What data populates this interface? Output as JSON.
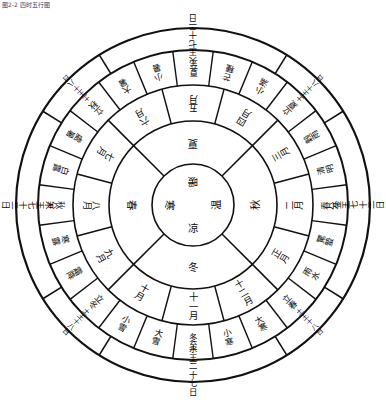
{
  "caption": "图2-2 四时五行图",
  "diagram": {
    "center": {
      "labels": [
        "暖",
        "温",
        "凉",
        "寒"
      ],
      "note": "center four qi"
    },
    "ring_season": {
      "name": "four-seasons-ring",
      "labels": [
        "夏",
        "秋",
        "冬",
        "春"
      ]
    },
    "ring_months": {
      "name": "twelve-months-ring",
      "labels": [
        "五月",
        "四月",
        "三月",
        "二月",
        "正月",
        "十二月",
        "十一月",
        "十月",
        "九月",
        "八月",
        "七月",
        "六月"
      ]
    },
    "ring_terms": {
      "name": "twentyfour-solar-terms-ring",
      "labels": [
        "夏至",
        "芒種",
        "小滿",
        "立夏",
        "穀雨",
        "清明",
        "春分",
        "驚蟄",
        "雨水",
        "立春",
        "大寒",
        "小寒",
        "冬至",
        "大雪",
        "小雪",
        "立冬",
        "霜降",
        "寒露",
        "秋分",
        "白露",
        "處暑",
        "立秋",
        "大暑",
        "小暑"
      ]
    },
    "ring_outer": {
      "name": "five-phase-rulership-ring",
      "cardinal": [
        {
          "pos": "top",
          "label": "火王七十二日"
        },
        {
          "pos": "right",
          "label": "金王七十二日"
        },
        {
          "pos": "bottom",
          "label": "水王二十七日"
        },
        {
          "pos": "left",
          "label": "木王七十二日"
        }
      ],
      "corners": [
        {
          "pos": "top-right",
          "label": "土王十八日"
        },
        {
          "pos": "bottom-right",
          "label": "土王十八日"
        },
        {
          "pos": "bottom-left",
          "label": "土王十八日"
        },
        {
          "pos": "top-left",
          "label": "土王十八日"
        }
      ]
    },
    "colors": {
      "ink": "#111111",
      "paper": "#ffffff",
      "caption": "#3a3a6a"
    }
  }
}
